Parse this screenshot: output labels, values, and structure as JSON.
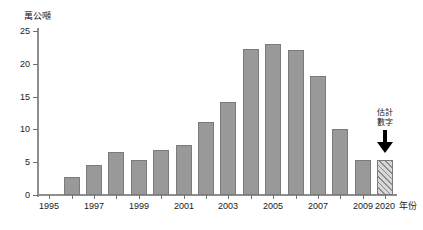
{
  "chart_data": {
    "type": "bar",
    "title": "",
    "subtitle": "",
    "ylabel": "萬公噸",
    "xlabel": "年份",
    "ylim": [
      0,
      25
    ],
    "y_ticks": [
      0,
      5,
      10,
      15,
      20,
      25
    ],
    "y_tick_labels": [
      "0",
      "5",
      "10",
      "15",
      "20",
      "25"
    ],
    "grid": false,
    "legend": null,
    "categories": [
      "1995",
      "1996",
      "1997",
      "1998",
      "1999",
      "2000",
      "2001",
      "2002",
      "2003",
      "2004",
      "2005",
      "2006",
      "2007",
      "2008",
      "2009",
      "2020"
    ],
    "x_tick_labels_shown": [
      "1995",
      "1997",
      "1999",
      "2001",
      "2003",
      "2005",
      "2007",
      "2009",
      "2020"
    ],
    "values": [
      null,
      2.7,
      4.6,
      6.6,
      5.4,
      6.8,
      7.7,
      11.2,
      14.2,
      22.2,
      23.0,
      22.1,
      18.1,
      10.1,
      5.3,
      5.3
    ],
    "bar_styles": [
      "none",
      "solid",
      "solid",
      "solid",
      "solid",
      "solid",
      "solid",
      "solid",
      "solid",
      "solid",
      "solid",
      "solid",
      "solid",
      "solid",
      "solid",
      "hatched"
    ],
    "annotations": [
      {
        "name": "estimate-note",
        "text": "估計\n數字",
        "target_category": "2020",
        "arrow": "down"
      }
    ],
    "colors": {
      "bar_fill": "#999999",
      "bar_stroke": "#7b7b7b",
      "estimate_hatch": "#8d8d8d",
      "estimate_fill": "#d8d8d8",
      "axis": "#8e8e8e",
      "text": "#1a1a1a",
      "arrow": "#000000",
      "background": "#ffffff"
    }
  }
}
